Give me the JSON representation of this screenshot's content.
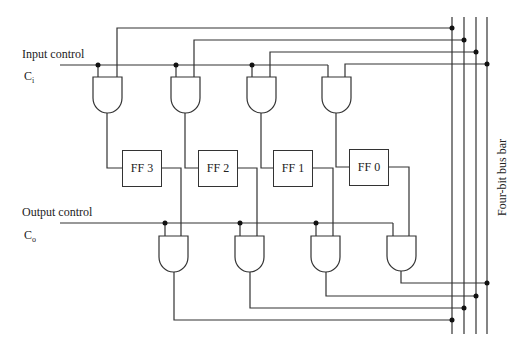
{
  "diagram": {
    "input_control": {
      "label": "Input control",
      "symbol": "C",
      "subscript": "i"
    },
    "output_control": {
      "label": "Output control",
      "symbol": "C",
      "subscript": "o"
    },
    "flip_flops": [
      {
        "label": "FF 3"
      },
      {
        "label": "FF 2"
      },
      {
        "label": "FF 1"
      },
      {
        "label": "FF 0"
      }
    ],
    "bus_label": "Four-bit bus bar",
    "gate_type": "AND",
    "colors": {
      "line": "#333333",
      "background": "#ffffff"
    }
  }
}
